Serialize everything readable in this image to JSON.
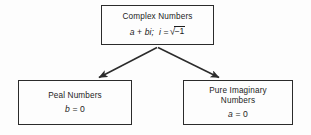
{
  "diagram": {
    "background_color": "#fdfdfd",
    "line_color": "#2b2b2b",
    "text_color": "#1c1c1c",
    "nodes": {
      "complex": {
        "label": "Complex Numbers",
        "formula_prefix": "a",
        "formula_plus": "+",
        "formula_bi": "bi;",
        "formula_i": "i",
        "formula_eq": "=",
        "formula_radical": "√",
        "formula_radicand": "−1",
        "formula_full": "a + bi;  i = √−1"
      },
      "real": {
        "label": "Peal Numbers",
        "formula_var": "b",
        "formula_eq": "=",
        "formula_val": "0",
        "formula_full": "b = 0"
      },
      "imaginary": {
        "label_line1": "Pure Imaginary",
        "label_line2": "Numbers",
        "formula_var": "a",
        "formula_eq": "=",
        "formula_val": "0",
        "formula_full": "a = 0"
      }
    },
    "connectors": [
      {
        "name": "arrow-complex-to-real",
        "from": "complex",
        "to": "real",
        "style": "solid-arrow"
      },
      {
        "name": "arrow-complex-to-imaginary",
        "from": "complex",
        "to": "imaginary",
        "style": "solid-arrow"
      }
    ]
  }
}
